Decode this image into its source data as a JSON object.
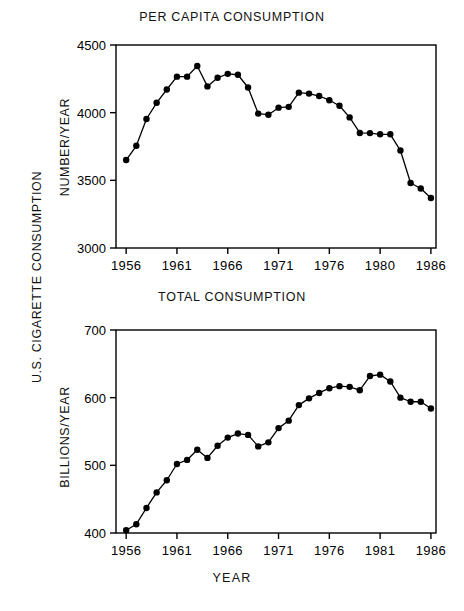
{
  "figure": {
    "outer_y_label": "U.S. CIGARETTE CONSUMPTION",
    "x_axis_name": "YEAR",
    "ink_color": "#000000",
    "background_color": "#ffffff"
  },
  "panels": [
    {
      "title": "PER CAPITA CONSUMPTION",
      "y_label": "NUMBER/YEAR",
      "y_ticks": [
        "3000",
        "3500",
        "4000",
        "4500"
      ],
      "x_ticks": [
        "1956",
        "1961",
        "1966",
        "1971",
        "1976",
        "1980",
        "1986"
      ]
    },
    {
      "title": "TOTAL CONSUMPTION",
      "y_label": "BILLIONS/YEAR",
      "y_ticks": [
        "400",
        "500",
        "600",
        "700"
      ],
      "x_ticks": [
        "1956",
        "1961",
        "1966",
        "1971",
        "1976",
        "1981",
        "1986"
      ]
    }
  ],
  "chart_data": [
    {
      "type": "line",
      "title": "PER CAPITA CONSUMPTION",
      "xlabel": "YEAR",
      "ylabel": "NUMBER/YEAR",
      "xlim": [
        1955,
        1986.5
      ],
      "ylim": [
        3000,
        4500
      ],
      "ytick_values": [
        3000,
        3500,
        4000,
        4500
      ],
      "xtick_values": [
        1956,
        1961,
        1966,
        1971,
        1976,
        1981,
        1986
      ],
      "xtick_labels": [
        "1956",
        "1961",
        "1966",
        "1971",
        "1976",
        "1980",
        "1986"
      ],
      "grid": false,
      "legend": "none",
      "markers": "filled-circle",
      "x": [
        1956,
        1957,
        1958,
        1959,
        1960,
        1961,
        1962,
        1963,
        1964,
        1965,
        1966,
        1967,
        1968,
        1969,
        1970,
        1971,
        1972,
        1973,
        1974,
        1975,
        1976,
        1977,
        1978,
        1979,
        1980,
        1981,
        1982,
        1983,
        1984,
        1985,
        1986
      ],
      "values": [
        3650,
        3755,
        3953,
        4073,
        4171,
        4266,
        4266,
        4345,
        4194,
        4258,
        4287,
        4280,
        4186,
        3993,
        3985,
        4037,
        4043,
        4148,
        4141,
        4123,
        4092,
        4051,
        3965,
        3850,
        3849,
        3840,
        3840,
        3720,
        3480,
        3440,
        3370
      ]
    },
    {
      "type": "line",
      "title": "TOTAL CONSUMPTION",
      "xlabel": "YEAR",
      "ylabel": "BILLIONS/YEAR",
      "xlim": [
        1955,
        1986.5
      ],
      "ylim": [
        400,
        700
      ],
      "ytick_values": [
        400,
        500,
        600,
        700
      ],
      "xtick_values": [
        1956,
        1961,
        1966,
        1971,
        1976,
        1981,
        1986
      ],
      "xtick_labels": [
        "1956",
        "1961",
        "1966",
        "1971",
        "1976",
        "1981",
        "1986"
      ],
      "grid": false,
      "legend": "none",
      "markers": "filled-circle",
      "x": [
        1956,
        1957,
        1958,
        1959,
        1960,
        1961,
        1962,
        1963,
        1964,
        1965,
        1966,
        1967,
        1968,
        1969,
        1970,
        1971,
        1972,
        1973,
        1974,
        1975,
        1976,
        1977,
        1978,
        1979,
        1980,
        1981,
        1982,
        1983,
        1984,
        1985,
        1986
      ],
      "values": [
        404,
        413,
        437,
        460,
        478,
        502,
        508,
        523,
        511,
        529,
        541,
        547,
        545,
        528,
        534,
        555,
        566,
        589,
        599,
        607,
        614,
        617,
        616,
        611,
        632,
        634,
        624,
        600,
        594,
        594,
        584
      ]
    }
  ]
}
